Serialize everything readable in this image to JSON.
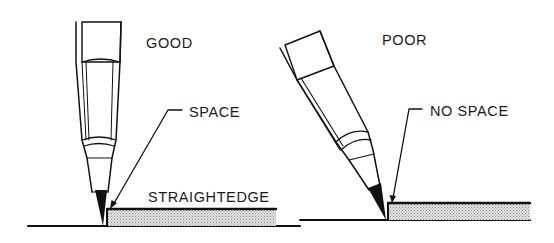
{
  "labels": {
    "good": "GOOD",
    "poor": "POOR",
    "space": "SPACE",
    "no_space": "NO SPACE",
    "straightedge": "STRAIGHTEDGE"
  },
  "colors": {
    "ink": "#111111",
    "background": "#ffffff",
    "straightedge_fill": "#d4d4d4",
    "knurl_fill": "#9a9a9a"
  },
  "panels": [
    {
      "id": "good",
      "title_key": "good",
      "pencil": "vertical, held slightly away so point sits in a small gap from the straightedge",
      "callout_key": "space"
    },
    {
      "id": "poor",
      "title_key": "poor",
      "pencil": "tilted, point jammed directly against straightedge",
      "callout_key": "no_space"
    }
  ]
}
